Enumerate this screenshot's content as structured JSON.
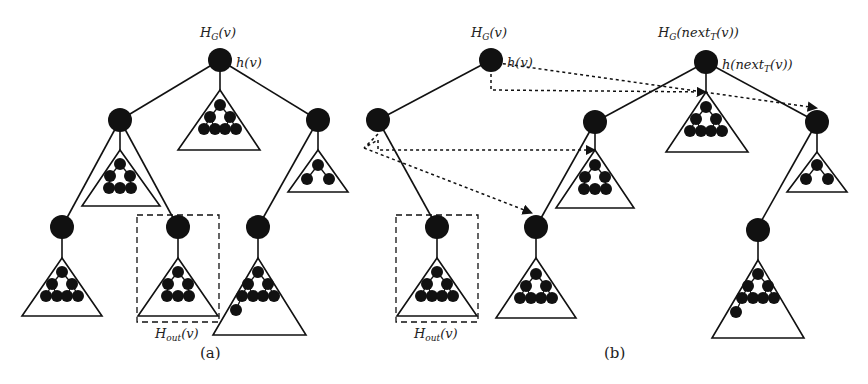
{
  "figure": {
    "panel_a": {
      "caption": "(a)",
      "root_label_above": "H",
      "root_label_above_sub": "G",
      "root_label_above_tail": "(v)",
      "root_label_right": "h(v)",
      "box_label": "H",
      "box_label_sub": "out",
      "box_label_tail": "(v)"
    },
    "panel_b": {
      "caption": "(b)",
      "left_root_label_above": "H",
      "left_root_label_above_sub": "G",
      "left_root_label_above_tail": "(v)",
      "left_root_label_right": "h(v)",
      "right_root_label_above_head": "H",
      "right_root_label_above_sub": "G",
      "right_root_label_above_tail1": "(next",
      "right_root_label_above_sub2": "T",
      "right_root_label_above_tail2": "(v))",
      "right_root_label_right_head": "h(next",
      "right_root_label_right_sub": "T",
      "right_root_label_right_tail": "(v))",
      "box_label": "H",
      "box_label_sub": "out",
      "box_label_tail": "(v)"
    }
  },
  "colors": {
    "ink": "#111111",
    "background": "#ffffff"
  }
}
